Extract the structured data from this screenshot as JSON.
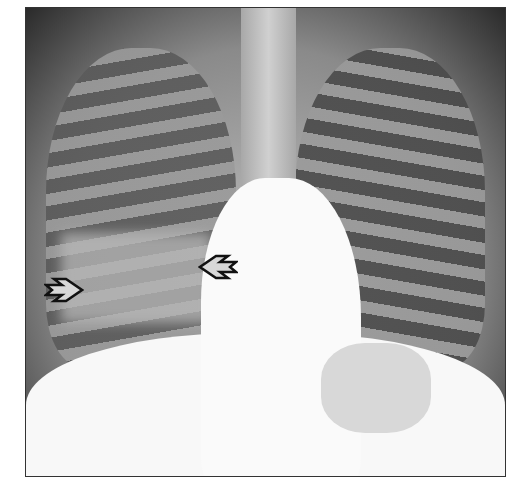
{
  "image": {
    "subject": "frontal chest radiograph",
    "description": "Chest X-ray with right lower lobe opacity indicated by two open arrows",
    "annotations": [
      {
        "type": "arrow",
        "direction": "right",
        "position": "right lower lung lateral"
      },
      {
        "type": "arrow",
        "direction": "left",
        "position": "right lower lung medial, adjacent to heart border"
      }
    ]
  }
}
